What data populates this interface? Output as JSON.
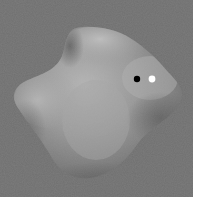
{
  "scene": {
    "description": "Grayscale rendered smooth 3D blob shape on gray background",
    "background_color": "#6f6f6f",
    "border_color": "#ffffff",
    "object": {
      "type": "smooth-blob",
      "base_color": "#8a8a8a",
      "highlight_color": "#c4c4c4",
      "shadow_color": "#555555"
    },
    "markers": [
      {
        "name": "black-dot",
        "x": 137,
        "y": 79,
        "color": "#000000"
      },
      {
        "name": "white-dot",
        "x": 152,
        "y": 79,
        "color": "#ffffff"
      }
    ]
  }
}
